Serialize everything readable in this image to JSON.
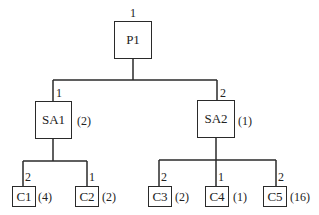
{
  "diagram": {
    "type": "tree",
    "root": {
      "id": "P1",
      "label": "P1",
      "edge_label": "1",
      "children": [
        {
          "id": "SA1",
          "label": "SA1",
          "edge_label": "1",
          "count": "(2)",
          "children": [
            {
              "id": "C1",
              "label": "C1",
              "edge_label": "2",
              "count": "(4)"
            },
            {
              "id": "C2",
              "label": "C2",
              "edge_label": "1",
              "count": "(2)"
            }
          ]
        },
        {
          "id": "SA2",
          "label": "SA2",
          "edge_label": "2",
          "count": "(1)",
          "children": [
            {
              "id": "C3",
              "label": "C3",
              "edge_label": "2",
              "count": "(2)"
            },
            {
              "id": "C4",
              "label": "C4",
              "edge_label": "1",
              "count": "(1)"
            },
            {
              "id": "C5",
              "label": "C5",
              "edge_label": "2",
              "count": "(16)"
            }
          ]
        }
      ]
    }
  },
  "nodes": {
    "p1": {
      "label": "P1",
      "edge": "1"
    },
    "sa1": {
      "label": "SA1",
      "edge": "1",
      "count": "(2)"
    },
    "sa2": {
      "label": "SA2",
      "edge": "2",
      "count": "(1)"
    },
    "c1": {
      "label": "C1",
      "edge": "2",
      "count": "(4)"
    },
    "c2": {
      "label": "C2",
      "edge": "1",
      "count": "(2)"
    },
    "c3": {
      "label": "C3",
      "edge": "2",
      "count": "(2)"
    },
    "c4": {
      "label": "C4",
      "edge": "1",
      "count": "(1)"
    },
    "c5": {
      "label": "C5",
      "edge": "2",
      "count": "(16)"
    }
  },
  "colors": {
    "line": "#2a2a2a",
    "background": "#ffffff"
  }
}
